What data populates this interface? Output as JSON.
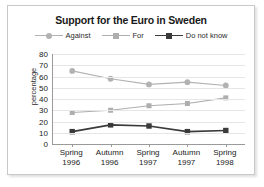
{
  "chart_data": {
    "type": "line",
    "title": "Support for the Euro in Sweden",
    "xlabel": "",
    "ylabel": "percentage",
    "categories": [
      "Spring 1996",
      "Autumn 1996",
      "Spring 1997",
      "Autumn 1997",
      "Spring 1998"
    ],
    "category_lines": [
      [
        "Spring",
        "1996"
      ],
      [
        "Autumn",
        "1996"
      ],
      [
        "Spring",
        "1997"
      ],
      [
        "Autumn",
        "1997"
      ],
      [
        "Spring",
        "1998"
      ]
    ],
    "ylim": [
      0,
      80
    ],
    "yticks": [
      80,
      70,
      60,
      50,
      40,
      30,
      20,
      10,
      0
    ],
    "grid": true,
    "legend_position": "top",
    "series": [
      {
        "name": "Against",
        "values": [
          65,
          58,
          53,
          55,
          52
        ],
        "color": "#b2b2b2",
        "marker": "circle"
      },
      {
        "name": "For",
        "values": [
          28,
          30,
          34,
          36,
          41
        ],
        "color": "#aeaeae",
        "marker": "square"
      },
      {
        "name": "Do not know",
        "values": [
          11,
          17,
          16,
          11,
          12
        ],
        "color": "#3a3a3a",
        "marker": "square"
      }
    ]
  },
  "colors": {
    "frame_border": "#c9c9c9",
    "axis": "#9a9a9a",
    "grid": "#e6e6e6",
    "text": "#1a1a1a"
  }
}
